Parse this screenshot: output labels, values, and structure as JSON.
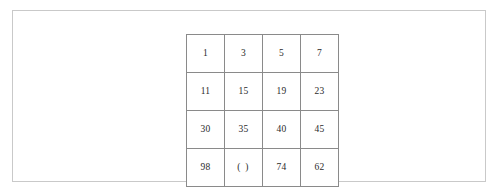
{
  "page": {
    "background_color": "#ffffff",
    "frame_border_color": "#c9c9c9"
  },
  "grid": {
    "name": "number-sequence-grid",
    "rows": 4,
    "columns": 4,
    "border_color": "#8a8a8a",
    "text_color": "#2b2b2b",
    "cells": [
      [
        "1",
        "3",
        "5",
        "7"
      ],
      [
        "11",
        "15",
        "19",
        "23"
      ],
      [
        "30",
        "35",
        "40",
        "45"
      ],
      [
        "98",
        "(  )",
        "74",
        "62"
      ]
    ]
  }
}
